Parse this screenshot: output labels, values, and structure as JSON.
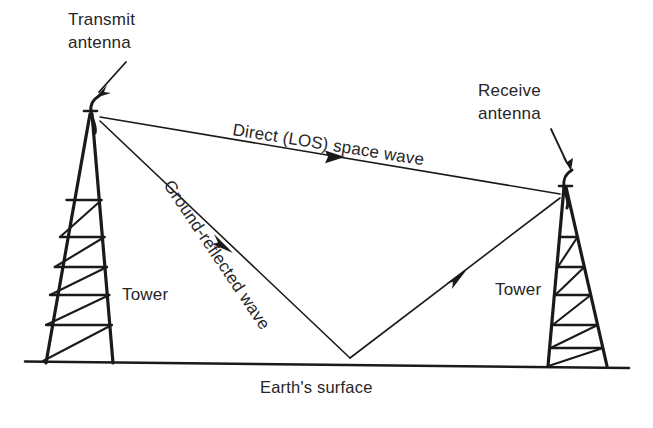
{
  "figure": {
    "background_color": "#ffffff",
    "ink_color": "#1a1a1a",
    "text_color": "#262626"
  },
  "labels": {
    "transmit_antenna_line1": "Transmit",
    "transmit_antenna_line2": "antenna",
    "receive_antenna_line1": "Receive",
    "receive_antenna_line2": "antenna",
    "direct_wave": "Direct (LOS) space wave",
    "reflected_wave": "Ground-reflected wave",
    "tower_left": "Tower",
    "tower_right": "Tower",
    "earth_surface": "Earth's surface"
  },
  "elements": {
    "left_tower": {
      "name": "transmit tower",
      "apex_x": 90,
      "apex_y": 113,
      "base_left_x": 46,
      "base_right_x": 113,
      "base_y": 363,
      "rungs": 5
    },
    "right_tower": {
      "name": "receive tower",
      "apex_x": 566,
      "apex_y": 186,
      "base_left_x": 548,
      "base_right_x": 607,
      "base_y": 366,
      "rungs": 5
    },
    "ground_line": {
      "x1": 25,
      "y1": 361,
      "x2": 629,
      "y2": 368
    },
    "direct_ray": {
      "from_x": 100,
      "from_y": 117,
      "to_x": 560,
      "to_y": 194,
      "arrow_at_x": 330,
      "arrow_at_y": 155
    },
    "reflected_ray_down": {
      "from_x": 100,
      "from_y": 120,
      "to_x": 350,
      "to_y": 358,
      "arrow_at_x": 222,
      "arrow_at_y": 243
    },
    "reflected_ray_up": {
      "from_x": 350,
      "from_y": 358,
      "to_x": 560,
      "to_y": 198,
      "arrow_at_x": 458,
      "arrow_at_y": 275
    },
    "reflection_point": {
      "x": 350,
      "y": 358
    }
  },
  "label_positions": {
    "transmit_text_x": 68,
    "transmit_text_y": 25,
    "receive_text_x": 478,
    "receive_text_y": 96,
    "direct_wave_x": 232,
    "direct_wave_y": 135,
    "direct_wave_rotation": 9,
    "reflected_wave_x": 163,
    "reflected_wave_y": 185,
    "reflected_wave_rotation": 56,
    "tower_left_x": 122,
    "tower_left_y": 300,
    "tower_right_x": 495,
    "tower_right_y": 295,
    "earth_surface_x": 260,
    "earth_surface_y": 393
  }
}
